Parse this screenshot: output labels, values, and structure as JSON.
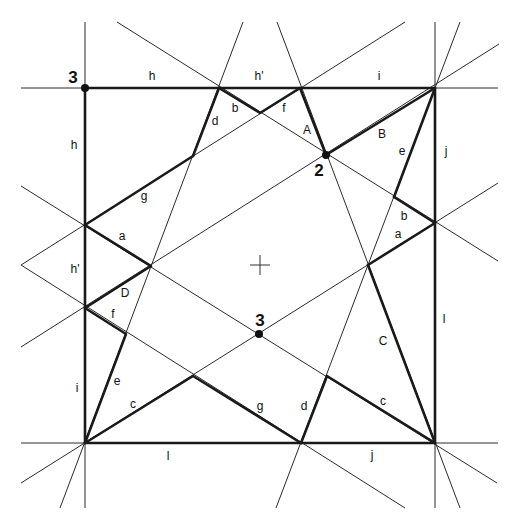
{
  "diagram": {
    "title": "",
    "point_labels": [
      {
        "text": "3",
        "x": 73,
        "y": 83
      },
      {
        "text": "2",
        "x": 319,
        "y": 176
      },
      {
        "text": "3",
        "x": 260,
        "y": 326
      }
    ],
    "edge_labels": [
      {
        "text": "h",
        "x": 152,
        "y": 80
      },
      {
        "text": "h'",
        "x": 259,
        "y": 80
      },
      {
        "text": "i",
        "x": 379,
        "y": 80
      },
      {
        "text": "h",
        "x": 74,
        "y": 149
      },
      {
        "text": "j",
        "x": 446,
        "y": 155
      },
      {
        "text": "b",
        "x": 235,
        "y": 112
      },
      {
        "text": "d",
        "x": 215,
        "y": 125
      },
      {
        "text": "f",
        "x": 284,
        "y": 112
      },
      {
        "text": "A",
        "x": 307,
        "y": 134
      },
      {
        "text": "B",
        "x": 382,
        "y": 138
      },
      {
        "text": "e",
        "x": 402,
        "y": 155
      },
      {
        "text": "g",
        "x": 144,
        "y": 200
      },
      {
        "text": "a",
        "x": 122,
        "y": 240
      },
      {
        "text": "b",
        "x": 404,
        "y": 220
      },
      {
        "text": "a",
        "x": 398,
        "y": 238
      },
      {
        "text": "h'",
        "x": 75,
        "y": 273
      },
      {
        "text": "D",
        "x": 125,
        "y": 297
      },
      {
        "text": "f",
        "x": 113,
        "y": 318
      },
      {
        "text": "i",
        "x": 77,
        "y": 392
      },
      {
        "text": "e",
        "x": 117,
        "y": 385
      },
      {
        "text": "c",
        "x": 133,
        "y": 408
      },
      {
        "text": "l",
        "x": 444,
        "y": 323
      },
      {
        "text": "C",
        "x": 383,
        "y": 345
      },
      {
        "text": "g",
        "x": 260,
        "y": 410
      },
      {
        "text": "d",
        "x": 304,
        "y": 410
      },
      {
        "text": "c",
        "x": 383,
        "y": 405
      },
      {
        "text": "l",
        "x": 168,
        "y": 460
      },
      {
        "text": "j",
        "x": 372,
        "y": 459
      }
    ],
    "center_cross": {
      "x": 260,
      "y": 265
    }
  }
}
